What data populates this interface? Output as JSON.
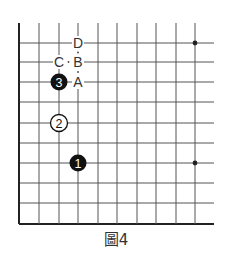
{
  "figure": {
    "caption": "圖4",
    "type": "go-board-diagram"
  },
  "board": {
    "columns_x": [
      19,
      39,
      59,
      78,
      98,
      117,
      137,
      156,
      176,
      195
    ],
    "right_extent": 214,
    "rows_y": [
      43,
      62,
      82,
      102,
      123,
      143,
      163,
      183,
      203
    ],
    "top_extent": 23,
    "bottom_edge_y": 224,
    "left_edge_x": 19,
    "line_color": "#555555",
    "edge_color": "#222222",
    "star_points": [
      {
        "x": 195,
        "y": 43
      },
      {
        "x": 195,
        "y": 163
      }
    ]
  },
  "stones": [
    {
      "number": "1",
      "color": "black",
      "x": 78,
      "y": 163
    },
    {
      "number": "2",
      "color": "white",
      "x": 59,
      "y": 123
    },
    {
      "number": "3",
      "color": "black",
      "x": 59,
      "y": 82
    }
  ],
  "labels": [
    {
      "text": "D",
      "x": 78,
      "y": 43
    },
    {
      "text": "B",
      "x": 78,
      "y": 62
    },
    {
      "text": "C",
      "x": 59,
      "y": 62
    },
    {
      "text": "A",
      "x": 78,
      "y": 82
    }
  ]
}
